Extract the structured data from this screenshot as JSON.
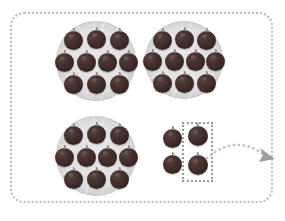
{
  "scene": {
    "title": "Grouping fruits: three full plates of ten plus a selected group of four",
    "background_color": "#ffffff",
    "frame": {
      "name": "worksheet-frame",
      "style": "dotted-rounded-rectangle",
      "color": "#b9b9b9"
    }
  },
  "colors": {
    "fruit": "#3d2a28",
    "fruit_highlight": "#5a4440",
    "plate": "#dcdcdc",
    "plate_edge": "#c3c3c3",
    "frame_border": "#b9b9b9",
    "selection_border": "#9a9a9a",
    "arrow": "#bdbdbd",
    "arrowhead": "#9e9e9e"
  },
  "plates": [
    {
      "name": "plate-top-left",
      "label": "Plate 1",
      "count": 10,
      "rows": [
        3,
        4,
        3
      ],
      "x": 56,
      "y": 21,
      "size": 80
    },
    {
      "name": "plate-top-right",
      "label": "Plate 2",
      "count": 10,
      "rows": [
        3,
        4,
        3
      ],
      "x": 145,
      "y": 21,
      "size": 78
    },
    {
      "name": "plate-bottom-left",
      "label": "Plate 3",
      "count": 10,
      "rows": [
        3,
        4,
        3
      ],
      "x": 56,
      "y": 116,
      "size": 80
    }
  ],
  "loose_items": {
    "name": "loose-fruit-group",
    "label": "Loose group",
    "count": 4,
    "rows": [
      2,
      2
    ],
    "positions": [
      {
        "x": 163,
        "y": 129,
        "size": 19
      },
      {
        "x": 188,
        "y": 126,
        "size": 20
      },
      {
        "x": 163,
        "y": 155,
        "size": 19
      },
      {
        "x": 188,
        "y": 155,
        "size": 20
      }
    ]
  },
  "selection": {
    "name": "selection-rectangle",
    "style": "dotted",
    "x": 182,
    "y": 122,
    "width": 31,
    "height": 60
  },
  "arrow": {
    "name": "drag-arrow",
    "style": "dotted-curve",
    "direction": "right",
    "from_x": 205,
    "from_y": 152,
    "to_x": 272,
    "to_y": 155
  },
  "totals": {
    "plates_of_ten": 3,
    "per_plate": 10,
    "loose": 4,
    "total": 34
  }
}
